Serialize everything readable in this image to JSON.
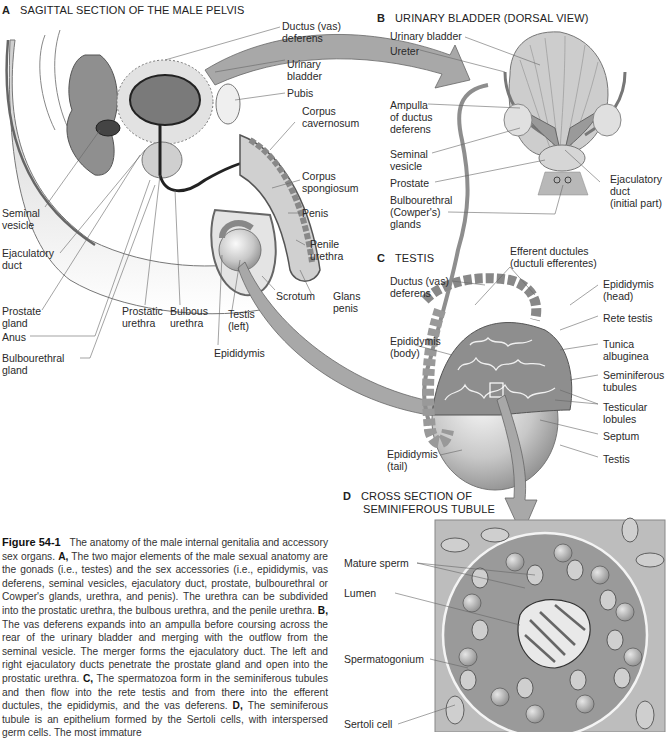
{
  "panels": {
    "A": {
      "letter": "A",
      "title": "SAGITTAL SECTION OF THE MALE PELVIS"
    },
    "B": {
      "letter": "B",
      "title": "URINARY BLADDER (DORSAL VIEW)"
    },
    "C": {
      "letter": "C",
      "title": "TESTIS"
    },
    "D": {
      "letter": "D",
      "title_line1": "CROSS SECTION OF",
      "title_line2": "SEMINIFEROUS TUBULE"
    }
  },
  "labels_a": {
    "ductus_vas_deferens": "Ductus (vas)\ndeferens",
    "urinary_bladder": "Urinary\nbladder",
    "pubis": "Pubis",
    "corpus_cavernosum": "Corpus\ncavernosum",
    "corpus_spongiosum": "Corpus\nspongiosum",
    "penis": "Penis",
    "penile_urethra": "Penile\nurethra",
    "glans_penis": "Glans\npenis",
    "scrotum": "Scrotum",
    "seminal_vesicle": "Seminal\nvesicle",
    "ejaculatory_duct": "Ejaculatory\nduct",
    "prostate_gland": "Prostate\ngland",
    "anus": "Anus",
    "bulbourethral_gland": "Bulbourethral\ngland",
    "prostatic_urethra": "Prostatic\nurethra",
    "bulbous_urethra": "Bulbous\nurethra",
    "testis_left": "Testis\n(left)",
    "epididymis": "Epididymis"
  },
  "labels_b": {
    "urinary_bladder": "Urinary bladder",
    "ureter": "Ureter",
    "ampulla": "Ampulla\nof ductus\ndeferens",
    "seminal_vesicle": "Seminal\nvesicle",
    "prostate": "Prostate",
    "bulbourethral": "Bulbourethral\n(Cowper's)\nglands",
    "ejaculatory_duct": "Ejaculatory\nduct\n(initial part)"
  },
  "labels_c": {
    "ductus_vas_deferens": "Ductus (vas)\ndeferens",
    "efferent_ductules": "Efferent ductules\n(ductuli efferentes)",
    "epididymis_head": "Epididymis\n(head)",
    "rete_testis": "Rete testis",
    "epididymis_body": "Epididymis\n(body)",
    "tunica_albuginea": "Tunica\nalbuginea",
    "seminiferous_tubules": "Seminiferous\ntubules",
    "testicular_lobules": "Testicular\nlobules",
    "septum": "Septum",
    "testis": "Testis",
    "epididymis_tail": "Epididymis\n(tail)"
  },
  "labels_d": {
    "mature_sperm": "Mature sperm",
    "lumen": "Lumen",
    "spermatogonium": "Spermatogonium",
    "sertoli_cell": "Sertoli cell"
  },
  "caption": {
    "figure_number": "Figure 54-1",
    "intro": "The anatomy of the male internal genitalia and accessory sex organs.",
    "a_marker": "A,",
    "a_text": "The two major elements of the male sexual anatomy are the gonads (i.e., testes) and the sex accessories (i.e., epididymis, vas deferens, seminal vesicles, ejaculatory duct, prostate, bulbourethral or Cowper's glands, urethra, and penis). The urethra can be subdivided into the prostatic urethra, the bulbous urethra, and the penile urethra.",
    "b_marker": "B,",
    "b_text": "The vas deferens expands into an ampulla before coursing across the rear of the urinary bladder and merging with the outflow from the seminal vesicle. The merger forms the ejaculatory duct. The left and right ejaculatory ducts penetrate the prostate gland and open into the prostatic urethra.",
    "c_marker": "C,",
    "c_text": "The spermatozoa form in the seminiferous tubules and then flow into the rete testis and from there into the efferent ductules, the epididymis, and the vas deferens.",
    "d_marker": "D,",
    "d_text": "The seminiferous tubule is an epithelium formed by the Sertoli cells, with interspersed germ cells. The most immature"
  },
  "colors": {
    "organ_fill": "#d9d9d9",
    "organ_dark": "#8c8c8c",
    "tubule_bg": "#9a9a9a",
    "arrow": "#a8a8a8",
    "line": "#555555"
  }
}
